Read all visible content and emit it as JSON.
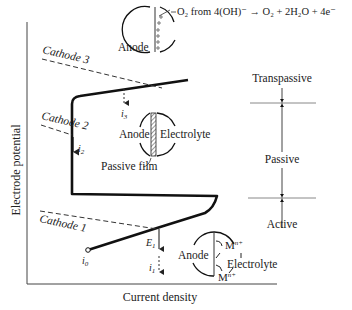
{
  "axes": {
    "y_label": "Electrode potential",
    "x_label": "Current density"
  },
  "cathodes": [
    {
      "label": "Cathode 3"
    },
    {
      "label": "Cathode 2"
    },
    {
      "label": "Cathode 1"
    }
  ],
  "currents": {
    "i0": {
      "base": "i",
      "sub": "0"
    },
    "i1": {
      "base": "i",
      "sub": "1"
    },
    "i2": {
      "base": "i",
      "sub": "2"
    },
    "i3": {
      "base": "i",
      "sub": "3"
    },
    "E1": {
      "base": "E",
      "sub": "1"
    }
  },
  "insets": {
    "transpassive": {
      "anode_label": "Anode",
      "reaction": "O₂ from 4(OH)⁻ → O₂ + 2H₂O + 4e⁻"
    },
    "passive": {
      "anode_label": "Anode",
      "electrolyte_label": "Electrolyte",
      "film_label": "Passive film"
    },
    "active": {
      "anode_label": "Anode",
      "electrolyte_label": "Electrolyte",
      "ion_top": "M",
      "ion_top_sup": "n+",
      "ion_bottom": "M",
      "ion_bottom_sup": "n+"
    }
  },
  "regions": {
    "transpassive": "Transpassive",
    "passive": "Passive",
    "active": "Active"
  }
}
